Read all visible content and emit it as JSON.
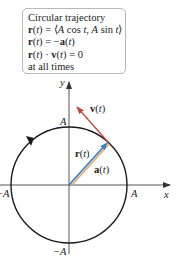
{
  "infobox": {
    "title": "Circular trajectory",
    "lines": [
      "r(t) = ⟨A cos t, A sin t⟩",
      "r(t) = −a(t)",
      "r(t) · v(t) = 0",
      "at all times"
    ]
  },
  "labels": {
    "y_axis": "y",
    "x_axis": "x",
    "top": "A",
    "bottom": "−A",
    "left": "−A",
    "right": "A",
    "velocity": "v(t)",
    "position": "r(t)",
    "acceleration": "a(t)"
  },
  "colors": {
    "velocity": "#c8453c",
    "position": "#3b7fc4",
    "acceleration": "#e8a66a",
    "circle": "#1a1a1a",
    "axis": "#555555"
  }
}
